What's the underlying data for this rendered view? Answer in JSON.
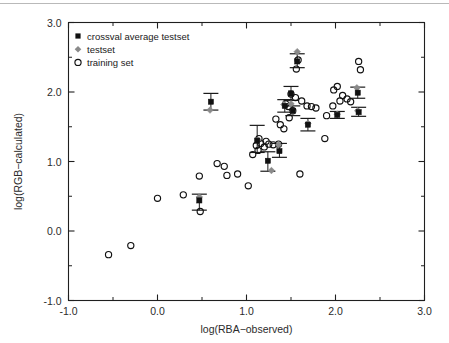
{
  "chart_data": {
    "type": "scatter",
    "title": "",
    "xlabel": "log(RBA−observed)",
    "ylabel": "log(RGB−calculated)",
    "xlim": [
      -1.0,
      3.0
    ],
    "ylim": [
      -1.0,
      3.0
    ],
    "xticks": [
      "-1.0",
      "0.0",
      "1.0",
      "2.0",
      "3.0"
    ],
    "yticks": [
      "-1.0",
      "0.0",
      "1.0",
      "2.0",
      "3.0"
    ],
    "xtick_values": [
      -1.0,
      0.0,
      1.0,
      2.0,
      3.0
    ],
    "ytick_values": [
      -1.0,
      0.0,
      1.0,
      2.0,
      3.0
    ],
    "minor_ticks": true,
    "grid": false,
    "legend_position": "upper left",
    "legend": [
      {
        "key": "crossval",
        "label": "crossval average testset",
        "marker": "filled-square",
        "color": "#111111"
      },
      {
        "key": "testset",
        "label": "testset",
        "marker": "diamond",
        "color": "#8a8a8a"
      },
      {
        "key": "training",
        "label": "training set",
        "marker": "open-circle",
        "color": "#111111"
      }
    ],
    "series": [
      {
        "name": "training set",
        "marker": "open-circle",
        "color": "#111111",
        "points": [
          [
            -0.55,
            -0.34
          ],
          [
            -0.3,
            -0.21
          ],
          [
            0.0,
            0.47
          ],
          [
            0.29,
            0.52
          ],
          [
            0.47,
            0.79
          ],
          [
            0.48,
            0.28
          ],
          [
            0.67,
            0.97
          ],
          [
            0.75,
            0.93
          ],
          [
            0.78,
            0.8
          ],
          [
            0.9,
            0.82
          ],
          [
            1.02,
            0.65
          ],
          [
            1.07,
            1.1
          ],
          [
            1.11,
            1.23
          ],
          [
            1.13,
            1.16
          ],
          [
            1.14,
            1.33
          ],
          [
            1.16,
            1.26
          ],
          [
            1.2,
            1.21
          ],
          [
            1.22,
            1.29
          ],
          [
            1.25,
            1.25
          ],
          [
            1.3,
            1.24
          ],
          [
            1.33,
            1.61
          ],
          [
            1.38,
            1.53
          ],
          [
            1.42,
            1.47
          ],
          [
            1.44,
            1.83
          ],
          [
            1.47,
            1.79
          ],
          [
            1.48,
            1.63
          ],
          [
            1.5,
            1.97
          ],
          [
            1.52,
            1.73
          ],
          [
            1.55,
            1.92
          ],
          [
            1.56,
            2.33
          ],
          [
            1.58,
            2.46
          ],
          [
            1.6,
            0.82
          ],
          [
            1.62,
            1.87
          ],
          [
            1.68,
            1.8
          ],
          [
            1.73,
            1.79
          ],
          [
            1.78,
            1.77
          ],
          [
            1.88,
            1.33
          ],
          [
            1.9,
            1.66
          ],
          [
            1.98,
            2.03
          ],
          [
            2.02,
            2.08
          ],
          [
            2.05,
            1.87
          ],
          [
            2.08,
            1.95
          ],
          [
            2.13,
            1.9
          ],
          [
            2.17,
            1.86
          ],
          [
            2.26,
            2.44
          ],
          [
            2.28,
            2.32
          ],
          [
            1.97,
            1.8
          ],
          [
            1.36,
            1.25
          ]
        ]
      },
      {
        "name": "testset",
        "marker": "diamond",
        "color": "#8a8a8a",
        "points": [
          [
            0.47,
            0.49
          ],
          [
            0.59,
            1.74
          ],
          [
            1.13,
            1.31
          ],
          [
            1.28,
            0.87
          ],
          [
            1.36,
            1.24
          ],
          [
            1.42,
            1.82
          ],
          [
            1.5,
            1.83
          ],
          [
            1.52,
            1.72
          ],
          [
            1.57,
            2.58
          ],
          [
            1.69,
            1.55
          ],
          [
            2.02,
            1.68
          ],
          [
            2.24,
            2.06
          ],
          [
            2.25,
            1.73
          ]
        ]
      },
      {
        "name": "crossval average testset",
        "marker": "filled-square",
        "color": "#111111",
        "points": [
          [
            0.47,
            0.44
          ],
          [
            0.6,
            1.86
          ],
          [
            1.12,
            1.3
          ],
          [
            1.24,
            1.01
          ],
          [
            1.37,
            1.15
          ],
          [
            1.43,
            1.8
          ],
          [
            1.5,
            1.98
          ],
          [
            1.52,
            1.73
          ],
          [
            1.57,
            2.44
          ],
          [
            1.69,
            1.53
          ],
          [
            2.02,
            1.67
          ],
          [
            2.25,
            1.99
          ],
          [
            2.26,
            1.71
          ]
        ],
        "errorbars": [
          {
            "x": 0.47,
            "y": 0.44,
            "lo": 0.3,
            "hi": 0.53
          },
          {
            "x": 0.6,
            "y": 1.86,
            "lo": 1.74,
            "hi": 1.98
          },
          {
            "x": 1.12,
            "y": 1.3,
            "lo": 1.13,
            "hi": 1.52
          },
          {
            "x": 1.24,
            "y": 1.01,
            "lo": 0.86,
            "hi": 1.14
          },
          {
            "x": 1.37,
            "y": 1.15,
            "lo": 1.06,
            "hi": 1.26
          },
          {
            "x": 1.43,
            "y": 1.8,
            "lo": 1.71,
            "hi": 1.89
          },
          {
            "x": 1.5,
            "y": 1.98,
            "lo": 1.88,
            "hi": 2.08
          },
          {
            "x": 1.52,
            "y": 1.73,
            "lo": 1.66,
            "hi": 1.8
          },
          {
            "x": 1.57,
            "y": 2.44,
            "lo": 2.35,
            "hi": 2.55
          },
          {
            "x": 1.69,
            "y": 1.53,
            "lo": 1.44,
            "hi": 1.62
          },
          {
            "x": 2.02,
            "y": 1.67,
            "lo": 1.62,
            "hi": 1.72
          },
          {
            "x": 2.25,
            "y": 1.99,
            "lo": 1.91,
            "hi": 2.07
          },
          {
            "x": 2.26,
            "y": 1.71,
            "lo": 1.65,
            "hi": 1.78
          }
        ]
      }
    ]
  }
}
